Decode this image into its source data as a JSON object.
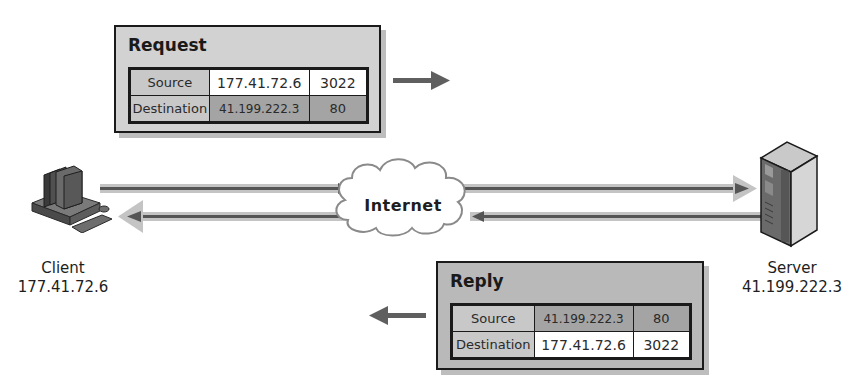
{
  "request": {
    "title": "Request",
    "rows": [
      {
        "label": "Source",
        "ip": "177.41.72.6",
        "port": "3022"
      },
      {
        "label": "Destination",
        "ip": "41.199.222.3",
        "port": "80"
      }
    ]
  },
  "reply": {
    "title": "Reply",
    "rows": [
      {
        "label": "Source",
        "ip": "41.199.222.3",
        "port": "80"
      },
      {
        "label": "Destination",
        "ip": "177.41.72.6",
        "port": "3022"
      }
    ]
  },
  "network": {
    "cloud_label": "Internet"
  },
  "client": {
    "name": "Client",
    "ip": "177.41.72.6",
    "icon": "desktop-computer-icon"
  },
  "server": {
    "name": "Server",
    "ip": "41.199.222.3",
    "icon": "server-tower-icon"
  },
  "colors": {
    "packet_bg": "#d2d2d2",
    "reply_bg": "#b9b9b9",
    "cell_dark": "#a4a4a4",
    "arrow_shaft": "#6b6b6b",
    "arrow_glow": "#bfbfbf"
  }
}
